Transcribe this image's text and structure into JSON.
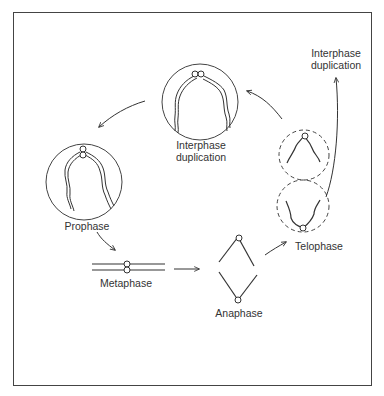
{
  "diagram": {
    "type": "cell-cycle-chromosome-diagram",
    "stages": [
      {
        "id": "prophase",
        "label": "Prophase"
      },
      {
        "id": "metaphase",
        "label": "Metaphase"
      },
      {
        "id": "anaphase",
        "label": "Anaphase"
      },
      {
        "id": "telophase",
        "label": "Telophase"
      },
      {
        "id": "interphase-top",
        "label_line1": "Interphase",
        "label_line2": "duplication"
      },
      {
        "id": "interphase-right",
        "label_line1": "Interphase",
        "label_line2": "duplication"
      }
    ],
    "flow": [
      "Interphase duplication",
      "Prophase",
      "Metaphase",
      "Anaphase",
      "Telophase",
      "Interphase duplication"
    ],
    "colors": {
      "stroke": "#333333",
      "background": "#ffffff"
    }
  }
}
